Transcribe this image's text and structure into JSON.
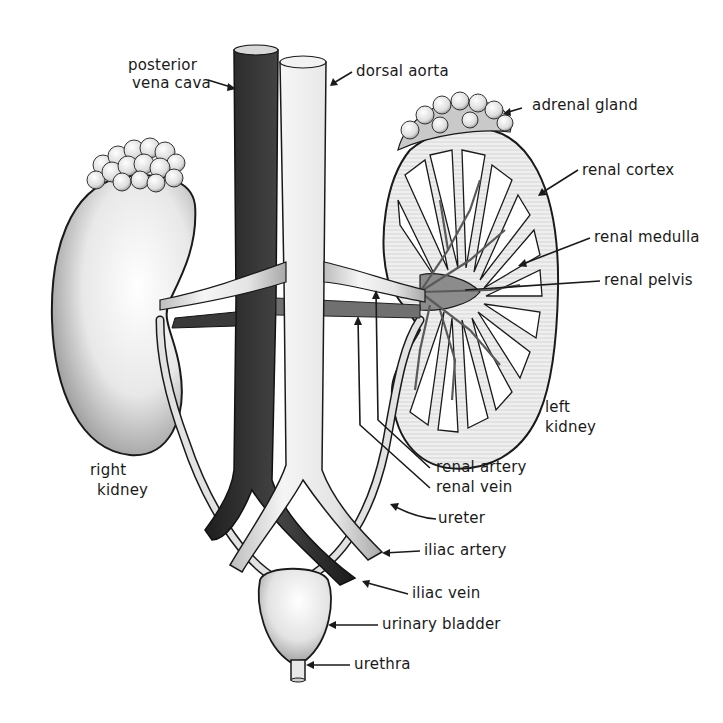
{
  "diagram": {
    "labels": {
      "posterior_vena_cava_1": "posterior",
      "posterior_vena_cava_2": "vena cava",
      "dorsal_aorta": "dorsal aorta",
      "adrenal_gland": "adrenal gland",
      "renal_cortex": "renal cortex",
      "renal_medulla": "renal medulla",
      "renal_pelvis": "renal pelvis",
      "left_kidney_1": "left",
      "left_kidney_2": "kidney",
      "right_kidney_1": "right",
      "right_kidney_2": "kidney",
      "renal_artery": "renal artery",
      "renal_vein": "renal vein",
      "ureter": "ureter",
      "iliac_artery": "iliac artery",
      "iliac_vein": "iliac vein",
      "urinary_bladder": "urinary bladder",
      "urethra": "urethra"
    },
    "colors": {
      "vein_dark": "#2e2e2e",
      "artery_light": "#e6e6e6",
      "organ_fill": "#d9d9d9",
      "outline": "#1a1a1a",
      "background": "#ffffff"
    }
  }
}
